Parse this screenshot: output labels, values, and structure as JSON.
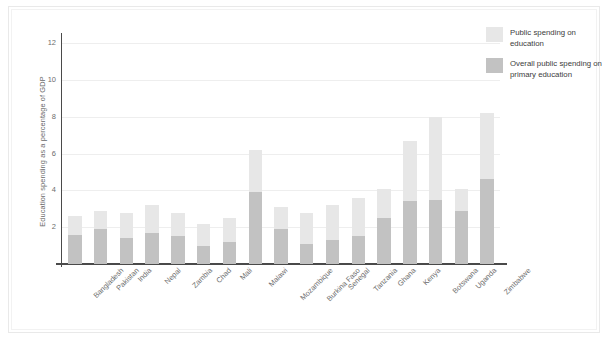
{
  "chart_data": {
    "type": "bar",
    "stacked": true,
    "title": "",
    "xlabel": "",
    "ylabel": "Education spending as a percentage of GDP",
    "ylim": [
      0,
      12.4
    ],
    "yticks": [
      2,
      4,
      6,
      8,
      10,
      12
    ],
    "grid": true,
    "legend_position": "top-right",
    "categories": [
      "Bangladesh",
      "Pakistan",
      "India",
      "Nepal",
      "Zambia",
      "Chad",
      "Mali",
      "Malawi",
      "Mozambique",
      "Burkina Faso",
      "Senegal",
      "Tanzania",
      "Ghana",
      "Kenya",
      "Botswana",
      "Uganda",
      "Zimbabwe"
    ],
    "series": [
      {
        "name": "Public spending on education",
        "color": "#e7e7e7",
        "values": [
          2.6,
          2.9,
          2.8,
          3.2,
          2.8,
          2.2,
          2.5,
          6.2,
          3.1,
          2.8,
          3.2,
          3.6,
          4.1,
          6.7,
          8.0,
          4.1,
          8.2
        ]
      },
      {
        "name": "Overall public spending on primary education",
        "color": "#c2c2c2",
        "values": [
          1.6,
          1.9,
          1.4,
          1.7,
          1.5,
          1.0,
          1.2,
          3.9,
          1.9,
          1.1,
          1.3,
          1.5,
          2.5,
          3.4,
          3.5,
          2.9,
          4.6
        ]
      }
    ]
  },
  "legend": {
    "items": [
      {
        "label": "Public spending on education",
        "color": "#e7e7e7"
      },
      {
        "label": "Overall public spending on primary education",
        "color": "#c2c2c2"
      }
    ]
  }
}
